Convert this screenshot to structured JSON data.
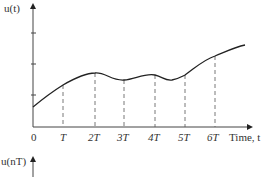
{
  "top_plot": {
    "ylabel": "u(t)",
    "xlabel": "Time, t",
    "origin_label": "0",
    "ticks": [
      "T",
      "2T",
      "3T",
      "4T",
      "5T",
      "6T"
    ]
  },
  "bottom_plot": {
    "ylabel": "u(nT)"
  },
  "colors": {
    "line": "#222222",
    "dashed": "#555555",
    "text": "#333333"
  }
}
